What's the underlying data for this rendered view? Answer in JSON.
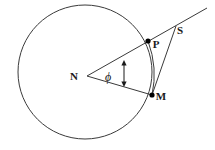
{
  "figure": {
    "kind": "geometry-diagram",
    "background_color": "#ffffff",
    "stroke_color": "#3a3a3a",
    "point_fill_color": "#000000",
    "label_color": "#1a1a1a",
    "width": 215,
    "height": 150
  },
  "circle": {
    "name": "main-circle",
    "center_x": 85,
    "center_y": 72,
    "radius": 67,
    "stroke_width": 1
  },
  "points": [
    {
      "id": "N",
      "label": "N",
      "x": 87,
      "y": 76,
      "label_x": 74,
      "label_y": 80,
      "has_dot": false,
      "role": "circle-center"
    },
    {
      "id": "P",
      "label": "P",
      "x": 148,
      "y": 41,
      "label_x": 153,
      "label_y": 48,
      "has_dot": true,
      "role": "point-on-circle"
    },
    {
      "id": "M",
      "label": "M",
      "x": 152,
      "y": 95,
      "label_x": 157,
      "label_y": 100,
      "has_dot": true,
      "role": "point-on-circle"
    },
    {
      "id": "S",
      "label": "S",
      "x": 174,
      "y": 28,
      "label_x": 178,
      "label_y": 34,
      "has_dot": false,
      "role": "external-intersection"
    }
  ],
  "segments": [
    {
      "id": "ray-N-P-extended",
      "label": "ray from N through P extending beyond",
      "x1": 87,
      "y1": 76,
      "x2": 207,
      "y2": 8
    },
    {
      "id": "radius-N-M",
      "label": "radius N to M",
      "x1": 87,
      "y1": 76,
      "x2": 152,
      "y2": 95
    },
    {
      "id": "segment-M-S",
      "label": "segment M to S",
      "x1": 152,
      "y1": 95,
      "x2": 176,
      "y2": 26
    },
    {
      "id": "segment-P-S-lower",
      "label": "curve-like segment from P down to M region",
      "x1": 148,
      "y1": 41,
      "x2": 152,
      "y2": 95
    }
  ],
  "angle_marker": {
    "id": "angle-phi",
    "symbol": "ϕ",
    "symbol_x": 108,
    "symbol_y": 81,
    "arrow_x": 124,
    "arrow_top_y": 61,
    "arrow_bottom_y": 86,
    "vertex_point": "N",
    "between_rays": [
      "ray-N-P-extended",
      "radius-N-M"
    ]
  },
  "point_markers": {
    "dot_radius": 2.6
  }
}
